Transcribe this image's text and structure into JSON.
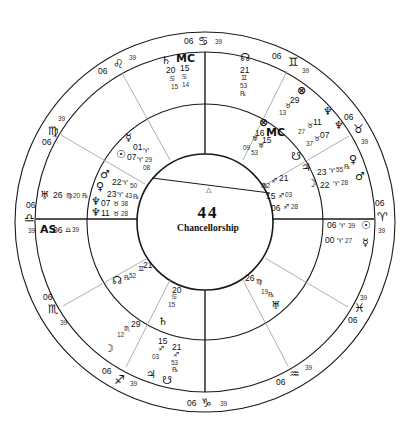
{
  "chart": {
    "title_number": "44",
    "title_text": "Chancellorship"
  },
  "zodiac_ring": [
    {
      "sign": "Cancer",
      "glyph": "♋",
      "deg": "06",
      "min": "39"
    },
    {
      "sign": "Gemini",
      "glyph": "♊",
      "deg": "06",
      "min": "39"
    },
    {
      "sign": "Taurus",
      "glyph": "♉",
      "deg": "06",
      "min": "39"
    },
    {
      "sign": "Aries",
      "glyph": "♈",
      "deg": "06",
      "min": "39"
    },
    {
      "sign": "Pisces",
      "glyph": "♓",
      "deg": "06",
      "min": "39"
    },
    {
      "sign": "Aquarius",
      "glyph": "♒",
      "deg": "06",
      "min": "39"
    },
    {
      "sign": "Capricorn",
      "glyph": "♑",
      "deg": "06",
      "min": "39"
    },
    {
      "sign": "Sagittarius",
      "glyph": "♐",
      "deg": "06",
      "min": "39"
    },
    {
      "sign": "Scorpio",
      "glyph": "♏",
      "deg": "06",
      "min": "39"
    },
    {
      "sign": "Libra",
      "glyph": "♎",
      "deg": "06",
      "min": "39"
    },
    {
      "sign": "Virgo",
      "glyph": "♍",
      "deg": "06",
      "min": "39"
    },
    {
      "sign": "Leo",
      "glyph": "♌",
      "deg": "06",
      "min": "39"
    }
  ],
  "outer_planets": {
    "saturn_top": {
      "glyph": "♄",
      "deg": "20",
      "sign": "♋",
      "min": "15"
    },
    "mc_top": {
      "label": "MC",
      "deg": "15",
      "sign": "♋",
      "min": "14"
    },
    "node_top": {
      "glyph": "☊",
      "deg": "21",
      "sign": "♊",
      "min": "53",
      "retro": "℞"
    },
    "pof_top": {
      "glyph": "⊗",
      "deg": "29",
      "sign": "♉",
      "min": "13"
    },
    "neptune_r1": {
      "glyph": "♆",
      "deg": "11",
      "sign": "♉",
      "min": "27"
    },
    "neptune_r2": {
      "glyph": "♆",
      "deg": "07",
      "sign": "♉",
      "min": "37"
    },
    "venus_r": {
      "glyph": "♀",
      "deg": "23",
      "sign": "♈",
      "min": "55",
      "retro": "℞"
    },
    "mars_r": {
      "glyph": "♂",
      "deg": "22",
      "sign": "♈",
      "min": "28"
    },
    "sun_r": {
      "glyph": "☉",
      "deg": "06",
      "sign": "♈",
      "min": "39"
    },
    "mercury_r": {
      "glyph": "☿",
      "deg": "00",
      "sign": "♈",
      "min": "27"
    },
    "uranus_l": {
      "glyph": "♅",
      "deg": "26",
      "sign": "♍",
      "min": "20",
      "retro": "℞"
    },
    "as_l": {
      "label": "AS",
      "deg": "06",
      "sign": "♎",
      "min": "39"
    },
    "moon_bl": {
      "glyph": "☽",
      "deg": "29",
      "sign": "♏",
      "min": "12",
      "retro": "℞"
    },
    "jupiter_b": {
      "glyph": "♃",
      "deg": "15",
      "sign": "♐",
      "min": "03"
    },
    "southnode_b": {
      "glyph": "☋",
      "deg": "21",
      "sign": "♐",
      "min": "53",
      "retro": "℞"
    }
  },
  "inner_planets": {
    "mercury_l": {
      "glyph": "☿"
    },
    "sun_l": {
      "glyph": "☉",
      "deg1": "01",
      "sign1": "♈",
      "deg2": "07",
      "sign2": "♈",
      "min": "29",
      "min2": "08"
    },
    "mars_l": {
      "glyph": "♂",
      "deg": "22",
      "sign": "♈",
      "min": "50"
    },
    "venus_l": {
      "glyph": "♀",
      "deg": "23",
      "sign": "♈",
      "min": "43",
      "retro": "℞"
    },
    "neptune_l1": {
      "glyph": "♆",
      "deg": "07",
      "sign": "♉",
      "min": "38"
    },
    "neptune_l2": {
      "glyph": "♆",
      "deg": "11",
      "sign": "♉",
      "min": "28"
    },
    "pof_r": {
      "glyph": "⊗",
      "label": "MC"
    },
    "uranus_r": {
      "deg1": "16",
      "deg2": "15",
      "sign": "♅",
      "min1": "09",
      "min2": "53"
    },
    "southnode_r": {
      "glyph": "☋"
    },
    "sag_r1": {
      "deg": "21",
      "sign": "♐",
      "min": "52",
      "retro": "℞"
    },
    "sag_r2": {
      "deg": "15",
      "sign": "♐",
      "min": "03"
    },
    "sag_r3": {
      "deg": "06",
      "sign": "♐",
      "min": "28"
    },
    "jupiter_r": {
      "glyph": "♃"
    },
    "moon_r": {
      "glyph": "☽"
    },
    "node_bl": {
      "glyph": "☊",
      "deg": "21",
      "sign": "♊",
      "min": "52",
      "retro": "℞"
    },
    "cancer_b": {
      "deg": "20",
      "sign": "♋",
      "min": "15"
    },
    "saturn_b": {
      "glyph": "♄"
    },
    "virgo_br": {
      "deg": "26",
      "sign": "♍",
      "min": "19",
      "retro": "℞"
    },
    "uranus_br": {
      "glyph": "♅"
    },
    "aspect_marker": {
      "glyph": "△"
    }
  }
}
